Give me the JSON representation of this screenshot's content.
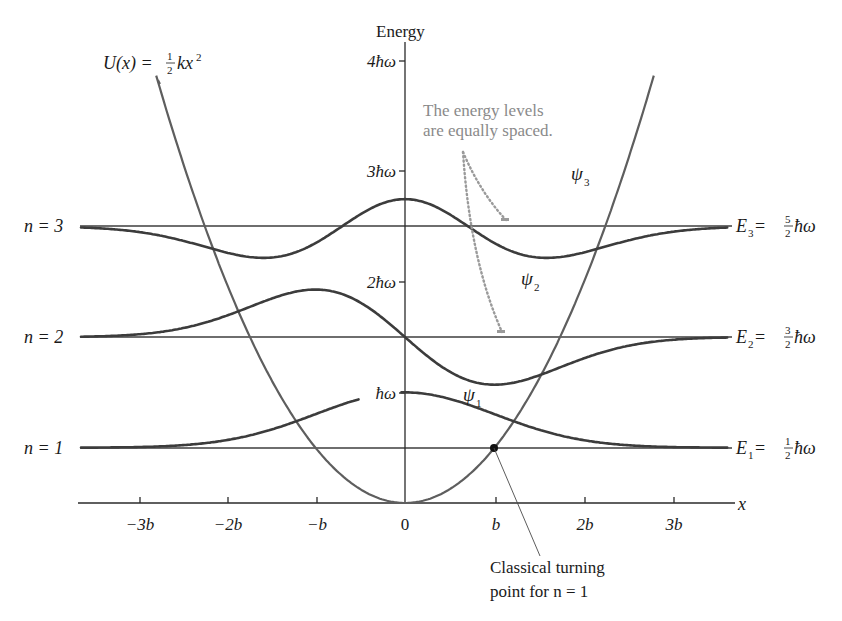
{
  "chart_data": {
    "type": "line",
    "xlabel": "x",
    "ylabel": "Energy",
    "x_ticks": [
      {
        "value": -3,
        "label": "−3b"
      },
      {
        "value": -2,
        "label": "−2b"
      },
      {
        "value": -1,
        "label": "−b"
      },
      {
        "value": 0,
        "label": "0"
      },
      {
        "value": 1,
        "label": "b"
      },
      {
        "value": 2,
        "label": "2b"
      },
      {
        "value": 3,
        "label": "3b"
      }
    ],
    "y_ticks": [
      {
        "value": 1,
        "label": "ħω"
      },
      {
        "value": 2,
        "label": "2ħω"
      },
      {
        "value": 3,
        "label": "3ħω"
      },
      {
        "value": 4,
        "label": "4ħω"
      }
    ],
    "xlim": [
      -3.7,
      3.7
    ],
    "ylim": [
      0,
      4.3
    ],
    "potential": {
      "label": "U(x) = ½kx²",
      "formula": "U = 0.5*(x/b)^2 (in units of ħω)"
    },
    "levels": [
      {
        "n": 1,
        "left_label": "n = 1",
        "right_label": "E₁ = ½ħω",
        "energy": 0.5,
        "psi_label": "ψ₁",
        "psi_amplitude": 0.5
      },
      {
        "n": 2,
        "left_label": "n = 2",
        "right_label": "E₂ = ³⁄₂ħω",
        "energy": 1.5,
        "psi_label": "ψ₂",
        "psi_amplitude": 0.43
      },
      {
        "n": 3,
        "left_label": "n = 3",
        "right_label": "E₃ = ⁵⁄₂ħω",
        "energy": 2.5,
        "psi_label": "ψ₃",
        "psi_amplitude": 0.33
      }
    ],
    "annotations": [
      {
        "text": "The energy levels are equally spaced.",
        "color": "#8a8a8a"
      },
      {
        "text": "Classical turning point for n = 1",
        "point": {
          "x": 1,
          "y": 0.5
        }
      }
    ],
    "grid": false,
    "legend": "none"
  },
  "labels": {
    "energy_axis": "Energy",
    "x_axis": "x",
    "potential_U": "U(x) = ",
    "potential_half_num": "1",
    "potential_half_den": "2",
    "potential_kx": "kx",
    "potential_sq": "2",
    "tick_4": "4ħω",
    "tick_3": "3ħω",
    "tick_2": "2ħω",
    "tick_1": "ħω",
    "xt_m3": "−3b",
    "xt_m2": "−2b",
    "xt_m1": "−b",
    "xt_0": "0",
    "xt_1": "b",
    "xt_2": "2b",
    "xt_3": "3b",
    "n3": "n = 3",
    "n2": "n = 2",
    "n1": "n = 1",
    "E3_lhs": "E",
    "E3_sub": "3",
    "E3_eq": " = ",
    "E3_num": "5",
    "E3_den": "2",
    "E2_lhs": "E",
    "E2_sub": "2",
    "E2_eq": " = ",
    "E2_num": "3",
    "E2_den": "2",
    "E1_lhs": "E",
    "E1_sub": "1",
    "E1_eq": " = ",
    "E1_num": "1",
    "E1_den": "2",
    "hbar_omega": "ħω",
    "psi": "ψ",
    "psi3_sub": "3",
    "psi2_sub": "2",
    "psi1_sub": "1",
    "note_line1": "The energy levels",
    "note_line2": "are equally spaced.",
    "turning_line1": "Classical turning",
    "turning_line2": "point for n = 1"
  },
  "colors": {
    "wavefunction": "#3c3c3c",
    "potential": "#5e5e5e",
    "level_line": "#6e6e6e",
    "annotation_gray": "#8a8a8a"
  }
}
